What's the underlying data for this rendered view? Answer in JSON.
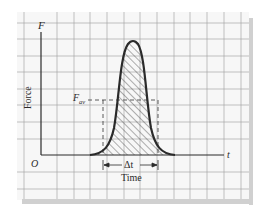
{
  "diagram": {
    "type": "force-time impulse graph",
    "axes": {
      "y_axis_symbol": "F",
      "y_axis_label": "Force",
      "x_axis_symbol": "t",
      "x_axis_label": "Time",
      "origin_label": "O"
    },
    "average_force": {
      "label_main": "F",
      "label_subscript": "av"
    },
    "interval": {
      "label": "Δt"
    },
    "curve": {
      "shape": "bell-shaped pulse",
      "fill": "hatched"
    },
    "colors": {
      "grid": "#9a9a9a",
      "axis": "#2a2a2a",
      "curve": "#2a2a2a",
      "hatch": "#3a3a3a",
      "frame_shadow": "#d0d0d0",
      "background": "#f7f7f7"
    }
  }
}
